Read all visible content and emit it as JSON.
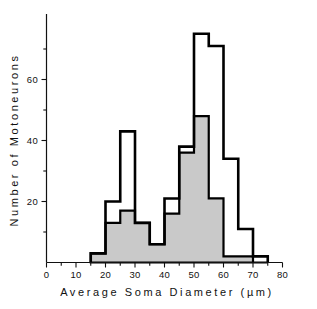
{
  "chart_data": {
    "type": "bar",
    "title": "",
    "subtitle": "",
    "xlabel": "Average  Soma  Diameter   (µm)",
    "ylabel": "Number  of  Motoneurons",
    "xlim": [
      0,
      80
    ],
    "ylim": [
      0,
      78
    ],
    "grid": false,
    "legend_position": "none",
    "bin_width": 5,
    "bin_edges": [
      15,
      20,
      25,
      30,
      35,
      40,
      45,
      50,
      55,
      60,
      65,
      70,
      75
    ],
    "categories": [
      "15-20",
      "20-25",
      "25-30",
      "30-35",
      "35-40",
      "40-45",
      "45-50",
      "50-55",
      "55-60",
      "60-65",
      "65-70",
      "70-75"
    ],
    "series": [
      {
        "name": "total-outline",
        "style": "outline",
        "color": "#000000",
        "values": [
          3,
          20,
          43,
          13,
          6,
          21,
          38,
          75,
          71,
          34,
          11,
          2
        ]
      },
      {
        "name": "shaded-subset",
        "style": "filled",
        "color": "#c9c9c9",
        "values": [
          3,
          13,
          17,
          13,
          6,
          16,
          36,
          48,
          21,
          2,
          2,
          0
        ]
      }
    ],
    "x_ticks": [
      {
        "value": 0,
        "label": "0",
        "major": true
      },
      {
        "value": 5,
        "label": "",
        "major": false
      },
      {
        "value": 10,
        "label": "10",
        "major": true
      },
      {
        "value": 15,
        "label": "",
        "major": false
      },
      {
        "value": 20,
        "label": "20",
        "major": true
      },
      {
        "value": 25,
        "label": "",
        "major": false
      },
      {
        "value": 30,
        "label": "30",
        "major": true
      },
      {
        "value": 35,
        "label": "",
        "major": false
      },
      {
        "value": 40,
        "label": "40",
        "major": true
      },
      {
        "value": 45,
        "label": "",
        "major": false
      },
      {
        "value": 50,
        "label": "50",
        "major": true
      },
      {
        "value": 55,
        "label": "",
        "major": false
      },
      {
        "value": 60,
        "label": "60",
        "major": true
      },
      {
        "value": 65,
        "label": "",
        "major": false
      },
      {
        "value": 70,
        "label": "70",
        "major": true
      },
      {
        "value": 75,
        "label": "",
        "major": false
      },
      {
        "value": 80,
        "label": "80",
        "major": true
      }
    ],
    "y_ticks": [
      {
        "value": 10,
        "label": "",
        "major": false
      },
      {
        "value": 20,
        "label": "20",
        "major": true
      },
      {
        "value": 30,
        "label": "",
        "major": false
      },
      {
        "value": 40,
        "label": "40",
        "major": true
      },
      {
        "value": 50,
        "label": "",
        "major": false
      },
      {
        "value": 60,
        "label": "60",
        "major": true
      },
      {
        "value": 70,
        "label": "",
        "major": false
      }
    ]
  },
  "axes": {
    "x_title": "Average  Soma  Diameter   (µm)",
    "y_title": "Number  of  Motoneurons",
    "x_tick_labels": [
      "0",
      "10",
      "20",
      "30",
      "40",
      "50",
      "60",
      "70",
      "80"
    ],
    "y_tick_labels": [
      "20",
      "40",
      "60"
    ]
  },
  "colors": {
    "background": "#ffffff",
    "ink": "#111111",
    "outline": "#000000",
    "fill": "#c9c9c9"
  }
}
